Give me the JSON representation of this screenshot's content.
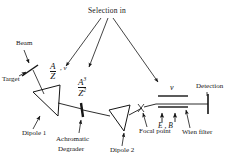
{
  "diagram": {
    "title_note": "Fragment separator beamline schematic",
    "labels": {
      "selection": "Selection in",
      "beam": "Beam",
      "target": "Target",
      "dipole1": "Dipole  1",
      "dipole2": "Dipole  2",
      "degrader_line1": "Achromatic",
      "degrader_line2": "Degrader",
      "focal_point": "Focal point",
      "wien_filter": "Wien filter",
      "detection": "Detection"
    },
    "quantities": {
      "az_numerator": "A",
      "az_denominator": "Z",
      "az_velocity": ", v",
      "az3_numerator": "A",
      "az3_num_exp": "3",
      "az3_denominator": "Z",
      "az3_den_exp": "2",
      "velocity_wien": "v",
      "field_e": "E",
      "field_sep": " , ",
      "field_b": "B"
    },
    "colors": {
      "ink": "#151515",
      "background": "#ffffff"
    }
  }
}
